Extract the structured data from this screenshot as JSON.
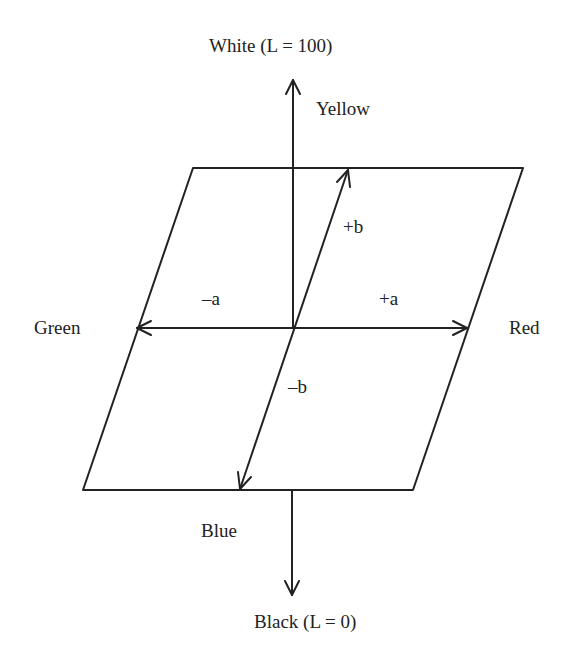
{
  "diagram": {
    "colors": {
      "stroke": "#222222",
      "background": "#ffffff",
      "text": "#222222"
    },
    "axes": {
      "L": {
        "top_label": "White (L = 100)",
        "bottom_label": "Black (L = 0)"
      },
      "a": {
        "positive_label": "+a",
        "negative_label": "–a",
        "positive_color": "Red",
        "negative_color": "Green"
      },
      "b": {
        "positive_label": "+b",
        "negative_label": "–b",
        "positive_color": "Yellow",
        "negative_color": "Blue"
      }
    }
  }
}
